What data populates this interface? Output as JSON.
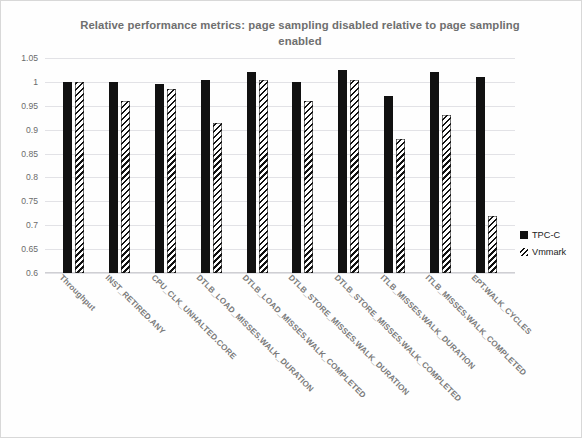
{
  "chart_data": {
    "type": "bar",
    "title": "Relative performance metrics: page sampling disabled relative to page sampling enabled",
    "xlabel": "",
    "ylabel": "",
    "ylim": [
      0.6,
      1.05
    ],
    "ytick_labels": [
      "1.05",
      "1",
      "0.95",
      "0.9",
      "0.85",
      "0.8",
      "0.75",
      "0.7",
      "0.65",
      "0.6"
    ],
    "ytick_values": [
      1.05,
      1,
      0.95,
      0.9,
      0.85,
      0.8,
      0.75,
      0.7,
      0.65,
      0.6
    ],
    "grid": true,
    "legend_position": "right",
    "categories": [
      "Throughput",
      "INST_RETIRED.ANY",
      "CPU_CLK_UNHALTED.CORE",
      "DTLB_LOAD_MISSES.WALK_DURATION",
      "DTLB_LOAD_MISSES.WALK_COMPLETED",
      "DTLB_STORE_MISSES.WALK_DURATION",
      "DTLB_STORE_MISSES.WALK_COMPLETED",
      "ITLB_MISSES.WALK_DURATION",
      "ITLB_MISSES.WALK_COMPLETED",
      "EPT.WALK_CYCLES"
    ],
    "series": [
      {
        "name": "TPC-C",
        "color": "#111111",
        "pattern": "solid",
        "values": [
          1.0,
          1.0,
          0.995,
          1.005,
          1.02,
          1.0,
          1.025,
          0.97,
          1.02,
          1.01
        ]
      },
      {
        "name": "Vmmark",
        "color": "#111111",
        "pattern": "diagonal-hatch",
        "values": [
          1.0,
          0.96,
          0.985,
          0.915,
          1.005,
          0.96,
          1.005,
          0.88,
          0.93,
          0.72
        ]
      }
    ]
  },
  "legend": {
    "items": [
      {
        "label": "TPC-C"
      },
      {
        "label": "Vmmark"
      }
    ]
  }
}
